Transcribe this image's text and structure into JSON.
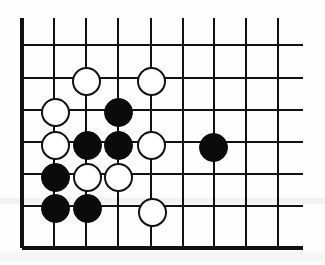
{
  "figure": {
    "type": "go-board-diagram",
    "width": 325,
    "height": 265,
    "background_color": "#ffffff",
    "line_color": "#111111",
    "black_stone_color": "#0b0b0b",
    "white_stone_fill": "#ffffff",
    "white_stone_border": "#111111"
  },
  "board": {
    "description": "Partial go board showing the lower-left corner region",
    "visible_columns": 9,
    "visible_rows": 7,
    "stone_diameter": 29,
    "line_thickness": 2,
    "edge_line_thickness": 4,
    "column_x": [
      22,
      54,
      86,
      118,
      151,
      183,
      214,
      246,
      278
    ],
    "row_y": [
      45,
      78,
      110,
      142,
      174,
      206,
      248
    ],
    "grid_extent": {
      "left": 22,
      "right": 303,
      "top": 18,
      "bottom": 248
    },
    "vertical_line_top": 18,
    "vertical_line_bottom": 248,
    "horizontal_line_left": 22,
    "horizontal_line_right": 303,
    "edges": {
      "left_edge_column_index": 0,
      "bottom_edge_row_index": 6
    }
  },
  "stones": [
    {
      "color": "white",
      "col": 2,
      "row": 2,
      "cx": 86,
      "cy": 81
    },
    {
      "color": "white",
      "col": 5,
      "row": 2,
      "cx": 151,
      "cy": 81
    },
    {
      "color": "white",
      "col": 1,
      "row": 3,
      "cx": 55,
      "cy": 112
    },
    {
      "color": "black",
      "col": 3,
      "row": 3,
      "cx": 118,
      "cy": 112
    },
    {
      "color": "white",
      "col": 1,
      "row": 4,
      "cx": 55,
      "cy": 145
    },
    {
      "color": "black",
      "col": 2,
      "row": 4,
      "cx": 87,
      "cy": 145
    },
    {
      "color": "black",
      "col": 3,
      "row": 4,
      "cx": 118,
      "cy": 145
    },
    {
      "color": "white",
      "col": 5,
      "row": 4,
      "cx": 151,
      "cy": 145
    },
    {
      "color": "black",
      "col": 7,
      "row": 4,
      "cx": 213,
      "cy": 147
    },
    {
      "color": "black",
      "col": 1,
      "row": 5,
      "cx": 55,
      "cy": 177
    },
    {
      "color": "white",
      "col": 2,
      "row": 5,
      "cx": 87,
      "cy": 177
    },
    {
      "color": "white",
      "col": 3,
      "row": 5,
      "cx": 118,
      "cy": 177
    },
    {
      "color": "black",
      "col": 1,
      "row": 6,
      "cx": 55,
      "cy": 208
    },
    {
      "color": "black",
      "col": 2,
      "row": 6,
      "cx": 87,
      "cy": 208
    },
    {
      "color": "white",
      "col": 5,
      "row": 6,
      "cx": 152,
      "cy": 212
    }
  ],
  "counts": {
    "black_stones": 7,
    "white_stones": 8,
    "total_stones": 15
  }
}
